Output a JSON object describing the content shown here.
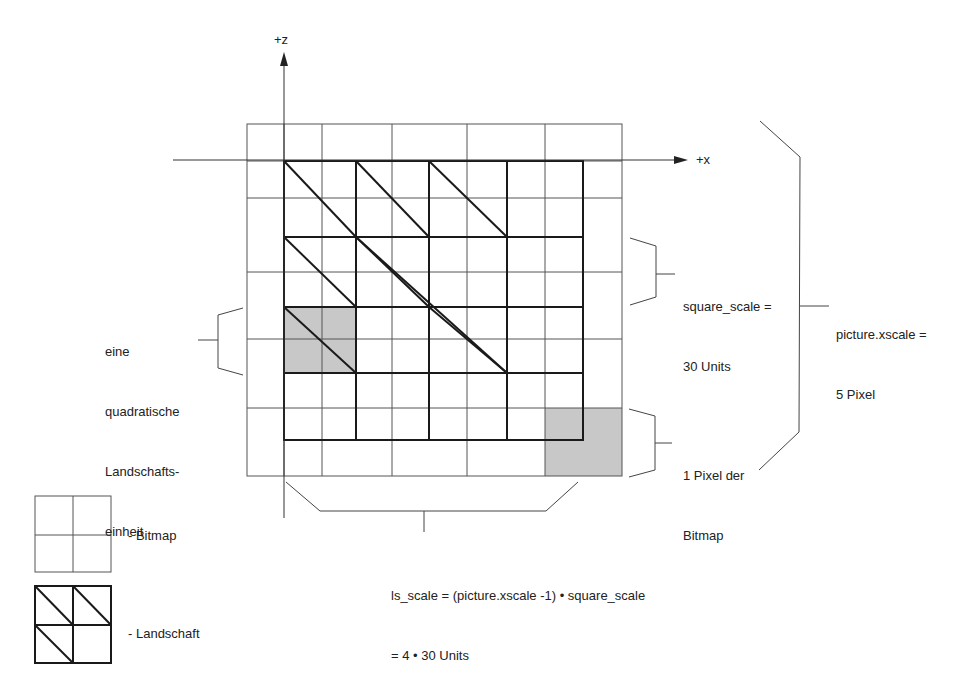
{
  "axes": {
    "z_label": "+z",
    "x_label": "+x"
  },
  "grid": {
    "bitmap_cols_x": [
      247,
      284,
      322,
      356,
      392,
      429,
      467,
      507,
      545,
      583,
      622
    ],
    "bitmap_rows_y": [
      124,
      161,
      198,
      237,
      272,
      307,
      339,
      373,
      408,
      440,
      476
    ],
    "landscape_cols_x": [
      284,
      356,
      429,
      507,
      583
    ],
    "landscape_rows_y": [
      161,
      237,
      307,
      373,
      440
    ],
    "highlight_colors": {
      "gray": "#c8c8c8"
    }
  },
  "annotations": {
    "square_scale": {
      "line1": "square_scale =",
      "line2": "30 Units"
    },
    "picture_xscale": {
      "line1": "picture.xscale =",
      "line2": "5 Pixel"
    },
    "one_pixel": {
      "line1": "1 Pixel der",
      "line2": "Bitmap"
    },
    "landscape_unit": {
      "line1": "eine",
      "line2": "quadratische",
      "line3": "Landschafts-",
      "line4": "einheit"
    },
    "ls_scale": {
      "line1": "ls_scale = (picture.xscale -1) • square_scale",
      "line2": "= 4 • 30 Units"
    }
  },
  "legend": {
    "bitmap": "- Bitmap",
    "landscape": "- Landschaft"
  }
}
